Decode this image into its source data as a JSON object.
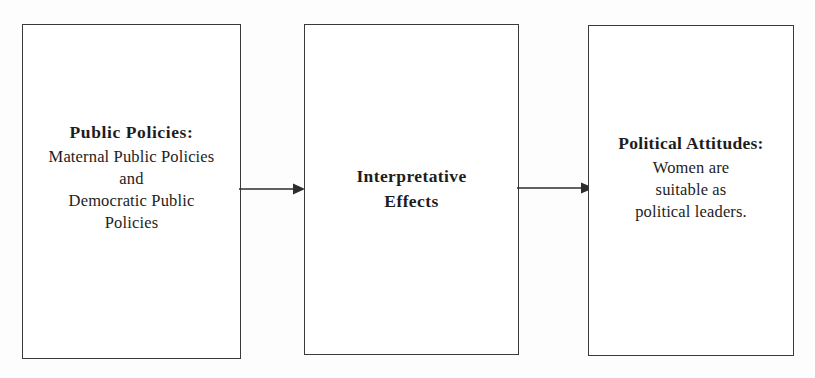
{
  "diagram": {
    "type": "flow-diagram",
    "background_color": "#fdfdfd",
    "line_color": "#3a3a3a",
    "text_color": "#1d1d1d",
    "nodes": [
      {
        "id": "public-policies",
        "title": "Public  Policies:",
        "lines": [
          "Maternal Public Policies",
          "and",
          "Democratic Public",
          "Policies"
        ]
      },
      {
        "id": "interpretative-effects",
        "title": "Interpretative",
        "lines": [
          "Effects"
        ]
      },
      {
        "id": "political-attitudes",
        "title": "Political Attitudes:",
        "lines": [
          "Women are",
          "suitable as",
          "political leaders."
        ]
      }
    ],
    "arrows": [
      {
        "id": "arrow-1",
        "from": "public-policies",
        "to": "interpretative-effects",
        "direction": "right"
      },
      {
        "id": "arrow-2",
        "from": "interpretative-effects",
        "to": "political-attitudes",
        "direction": "right"
      }
    ]
  }
}
